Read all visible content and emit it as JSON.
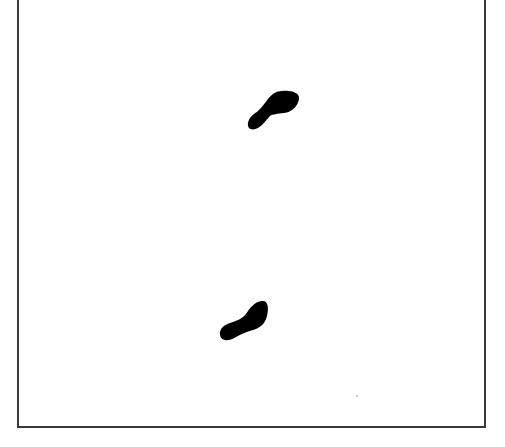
{
  "figure": {
    "frame_color": "#3a3a3a",
    "background_color": "#ffffff",
    "footprints": [
      {
        "id": "upper",
        "color": "#000000",
        "center": [
          273,
          110
        ]
      },
      {
        "id": "lower",
        "color": "#000000",
        "center": [
          244,
          322
        ]
      }
    ],
    "specks": [
      {
        "x": 357,
        "y": 396
      }
    ]
  }
}
